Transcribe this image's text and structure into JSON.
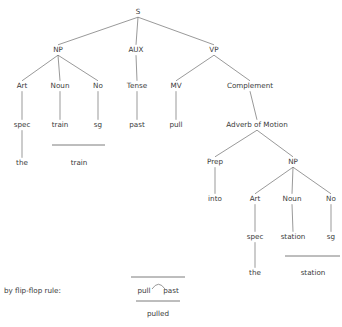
{
  "diagram": {
    "title_visible": false,
    "type": "syntactic-phrase-structure-tree",
    "colors": {
      "background": "#ffffff",
      "line": "#6d6d6d",
      "text": "#3a3a3a"
    },
    "nodes": [
      {
        "id": "S",
        "label": "S",
        "x": 138,
        "y": 14
      },
      {
        "id": "NP1",
        "label": "NP",
        "x": 58,
        "y": 52
      },
      {
        "id": "AUX",
        "label": "AUX",
        "x": 136,
        "y": 52
      },
      {
        "id": "VP",
        "label": "VP",
        "x": 214,
        "y": 52
      },
      {
        "id": "Art1",
        "label": "Art",
        "x": 22,
        "y": 88
      },
      {
        "id": "Noun1",
        "label": "Noun",
        "x": 60,
        "y": 88
      },
      {
        "id": "No1",
        "label": "No",
        "x": 98,
        "y": 88
      },
      {
        "id": "Tense",
        "label": "Tense",
        "x": 137,
        "y": 88
      },
      {
        "id": "MV",
        "label": "MV",
        "x": 176,
        "y": 88
      },
      {
        "id": "Complement",
        "label": "Complement",
        "x": 250,
        "y": 88
      },
      {
        "id": "spec1",
        "label": "spec",
        "x": 22,
        "y": 127
      },
      {
        "id": "train",
        "label": "train",
        "x": 60,
        "y": 127
      },
      {
        "id": "sg1",
        "label": "sg",
        "x": 98,
        "y": 127
      },
      {
        "id": "past",
        "label": "past",
        "x": 137,
        "y": 127
      },
      {
        "id": "pull",
        "label": "pull",
        "x": 176,
        "y": 127
      },
      {
        "id": "AdvMotion",
        "label": "Adverb of Motion",
        "x": 257,
        "y": 127
      },
      {
        "id": "the1",
        "label": "the",
        "x": 22,
        "y": 165
      },
      {
        "id": "trainLex",
        "label": "train",
        "x": 79,
        "y": 165
      },
      {
        "id": "Prep",
        "label": "Prep",
        "x": 215,
        "y": 164
      },
      {
        "id": "NP2",
        "label": "NP",
        "x": 293,
        "y": 164
      },
      {
        "id": "into",
        "label": "into",
        "x": 215,
        "y": 201
      },
      {
        "id": "Art2",
        "label": "Art",
        "x": 255,
        "y": 201
      },
      {
        "id": "Noun2",
        "label": "Noun",
        "x": 292,
        "y": 201
      },
      {
        "id": "No2",
        "label": "No",
        "x": 331,
        "y": 201
      },
      {
        "id": "spec2",
        "label": "spec",
        "x": 255,
        "y": 239
      },
      {
        "id": "station",
        "label": "station",
        "x": 293,
        "y": 239
      },
      {
        "id": "sg2",
        "label": "sg",
        "x": 331,
        "y": 239
      },
      {
        "id": "the2",
        "label": "the",
        "x": 255,
        "y": 275
      },
      {
        "id": "stationLex",
        "label": "station",
        "x": 313,
        "y": 275
      }
    ],
    "edges": [
      {
        "from": "S",
        "to": "NP1"
      },
      {
        "from": "S",
        "to": "AUX"
      },
      {
        "from": "S",
        "to": "VP"
      },
      {
        "from": "NP1",
        "to": "Art1"
      },
      {
        "from": "NP1",
        "to": "Noun1"
      },
      {
        "from": "NP1",
        "to": "No1"
      },
      {
        "from": "AUX",
        "to": "Tense"
      },
      {
        "from": "VP",
        "to": "MV"
      },
      {
        "from": "VP",
        "to": "Complement"
      },
      {
        "from": "Art1",
        "to": "spec1"
      },
      {
        "from": "Noun1",
        "to": "train"
      },
      {
        "from": "No1",
        "to": "sg1"
      },
      {
        "from": "Tense",
        "to": "past"
      },
      {
        "from": "MV",
        "to": "pull"
      },
      {
        "from": "Complement",
        "to": "AdvMotion"
      },
      {
        "from": "spec1",
        "to": "the1"
      },
      {
        "from": "AdvMotion",
        "to": "Prep"
      },
      {
        "from": "AdvMotion",
        "to": "NP2"
      },
      {
        "from": "Prep",
        "to": "into"
      },
      {
        "from": "NP2",
        "to": "Art2"
      },
      {
        "from": "NP2",
        "to": "Noun2"
      },
      {
        "from": "NP2",
        "to": "No2"
      },
      {
        "from": "Art2",
        "to": "spec2"
      },
      {
        "from": "Noun2",
        "to": "station"
      },
      {
        "from": "No2",
        "to": "sg2"
      },
      {
        "from": "spec2",
        "to": "the2"
      }
    ],
    "brackets": [
      {
        "id": "train-bracket",
        "x1": 52,
        "x2": 105,
        "y": 145,
        "result": "train"
      },
      {
        "id": "station-bracket",
        "x1": 285,
        "x2": 340,
        "y": 256,
        "result": "station"
      }
    ],
    "flip_flop": {
      "label": "by flip-flop rule:",
      "label_x": 4,
      "label_y": 293,
      "top_bar": {
        "x1": 131,
        "x2": 185,
        "y": 277
      },
      "left_term": {
        "label": "pull",
        "x": 144,
        "y": 293
      },
      "right_term": {
        "label": "past",
        "x": 171,
        "y": 293
      },
      "arc": {
        "x1": 152,
        "x2": 165,
        "peak_y": 283,
        "base_y": 289
      },
      "bottom_bar": {
        "x1": 136,
        "x2": 180,
        "y": 301
      },
      "result": {
        "label": "pulled",
        "x": 158,
        "y": 316
      }
    }
  }
}
